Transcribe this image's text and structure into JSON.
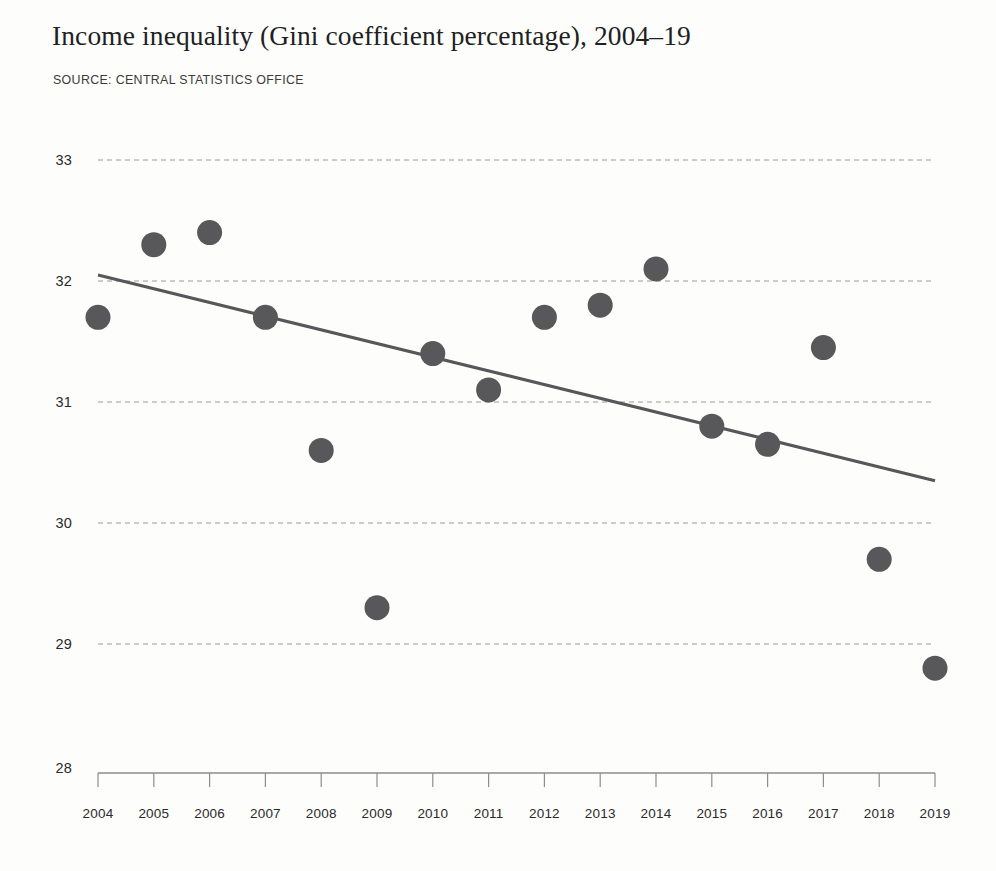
{
  "chart_data": {
    "type": "scatter",
    "title": "Income inequality (Gini coefficient percentage), 2004–19",
    "source": "SOURCE: CENTRAL STATISTICS OFFICE",
    "xlabel": "",
    "ylabel": "",
    "ylim": [
      28,
      33
    ],
    "yticks": [
      33,
      32,
      31,
      30,
      29,
      28
    ],
    "grid": true,
    "legend": "none",
    "categories": [
      2004,
      2005,
      2006,
      2007,
      2008,
      2009,
      2010,
      2011,
      2012,
      2013,
      2014,
      2015,
      2016,
      2017,
      2018,
      2019
    ],
    "x": [
      "2004",
      "2005",
      "2006",
      "2007",
      "2008",
      "2009",
      "2010",
      "2011",
      "2012",
      "2013",
      "2014",
      "2015",
      "2016",
      "2017",
      "2018",
      "2019"
    ],
    "values": [
      31.7,
      32.3,
      32.4,
      31.7,
      30.6,
      29.3,
      31.4,
      31.1,
      31.7,
      31.8,
      32.1,
      30.8,
      30.65,
      31.45,
      29.7,
      28.8
    ],
    "series": [
      {
        "name": "Gini coefficient (%)",
        "values": [
          31.7,
          32.3,
          32.4,
          31.7,
          30.6,
          29.3,
          31.4,
          31.1,
          31.7,
          31.8,
          32.1,
          30.8,
          30.65,
          31.45,
          29.7,
          28.8
        ]
      },
      {
        "name": "Linear trend",
        "type": "line",
        "x_endpoints": [
          "2004",
          "2019"
        ],
        "y_endpoints": [
          32.05,
          30.35
        ]
      }
    ],
    "annotations": []
  },
  "colors": {
    "dot": "#58585a",
    "trend": "#57575a",
    "grid": "#9a9a98",
    "axis": "#8d8d8b",
    "text": "#221f1f",
    "background": "#fdfdfc"
  },
  "labels": {
    "y_axis_ticks": [
      "33",
      "32",
      "31",
      "30",
      "29",
      "28"
    ],
    "x_axis_ticks": [
      "2004",
      "2005",
      "2006",
      "2007",
      "2008",
      "2009",
      "2010",
      "2011",
      "2012",
      "2013",
      "2014",
      "2015",
      "2016",
      "2017",
      "2018",
      "2019"
    ]
  }
}
